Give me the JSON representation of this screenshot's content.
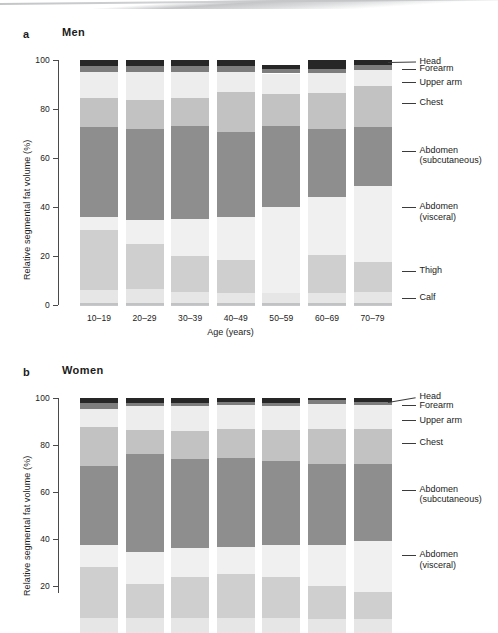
{
  "figure": {
    "panels": [
      {
        "letter": "a",
        "title": "Men",
        "ylabel": "Relative segmental fat volume (%)",
        "xlabel": "Age (years)"
      },
      {
        "letter": "b",
        "title": "Women",
        "ylabel": "Relative segmental fat volume (%)",
        "xlabel": "Age (years)"
      }
    ]
  },
  "legend": {
    "items": [
      {
        "label": "Head",
        "color": "#262626"
      },
      {
        "label": "Forearm",
        "color": "#7d7d7d"
      },
      {
        "label": "Upper arm",
        "color": "#ededed"
      },
      {
        "label": "Chest",
        "color": "#c2c2c2"
      },
      {
        "label": "Abdomen\n(subcutaneous)",
        "line1": "Abdomen",
        "line2": "(subcutaneous)",
        "color": "#8e8e8e"
      },
      {
        "label": "Abdomen\n(visceral)",
        "line1": "Abdomen",
        "line2": "(visceral)",
        "color": "#f0f0f0"
      },
      {
        "label": "Thigh",
        "color": "#cfcfcf"
      },
      {
        "label": "Calf",
        "color": "#e6e6e6"
      }
    ]
  },
  "chart_data": {
    "type": "bar",
    "subtype": "stacked-percent",
    "xlabel": "Age (years)",
    "ylabel": "Relative segmental fat volume (%)",
    "ylim": [
      0,
      100
    ],
    "yticks": [
      0,
      20,
      40,
      60,
      80,
      100
    ],
    "grid": false,
    "legend_position": "right",
    "categories": [
      "10–19",
      "20–29",
      "30–39",
      "40–49",
      "50–59",
      "60–69",
      "70–79"
    ],
    "segment_order_bottom_to_top": [
      "Calf",
      "Thigh",
      "Abdomen (visceral)",
      "Abdomen (subcutaneous)",
      "Chest",
      "Upper arm",
      "Forearm",
      "Head"
    ],
    "panels": [
      {
        "letter": "a",
        "name": "Men",
        "series": [
          {
            "name": "Calf",
            "color": "#e6e6e6",
            "values": [
              6.0,
              6.5,
              5.5,
              5.0,
              5.0,
              5.0,
              5.5
            ]
          },
          {
            "name": "Thigh",
            "color": "#cfcfcf",
            "values": [
              24.5,
              18.5,
              14.5,
              13.5,
              0.0,
              15.5,
              12.0
            ]
          },
          {
            "name": "Abdomen (visceral)",
            "color": "#f0f0f0",
            "values": [
              5.5,
              9.5,
              15.0,
              17.5,
              35.0,
              23.5,
              31.0
            ]
          },
          {
            "name": "Abdomen (subcutaneous)",
            "color": "#8e8e8e",
            "values": [
              36.5,
              37.5,
              38.0,
              34.5,
              33.0,
              28.0,
              24.0
            ]
          },
          {
            "name": "Chest",
            "color": "#c2c2c2",
            "values": [
              12.0,
              11.5,
              11.5,
              16.5,
              13.0,
              14.5,
              17.0
            ]
          },
          {
            "name": "Upper arm",
            "color": "#ededed",
            "values": [
              10.5,
              11.5,
              10.5,
              8.0,
              8.5,
              8.0,
              6.5
            ]
          },
          {
            "name": "Forearm",
            "color": "#7d7d7d",
            "values": [
              2.5,
              2.5,
              2.5,
              2.5,
              2.0,
              2.0,
              2.0
            ]
          },
          {
            "name": "Head",
            "color": "#262626",
            "values": [
              2.5,
              2.5,
              2.5,
              2.5,
              1.5,
              3.5,
              2.0
            ]
          }
        ]
      },
      {
        "letter": "b",
        "name": "Women",
        "note": "Panel is cropped at the bottom of the image; axis visible to 20%.",
        "series": [
          {
            "name": "Calf",
            "color": "#e6e6e6",
            "values": [
              6.5,
              6.5,
              6.5,
              6.5,
              6.5,
              6.0,
              6.0
            ]
          },
          {
            "name": "Thigh",
            "color": "#cfcfcf",
            "values": [
              21.5,
              14.5,
              17.5,
              18.5,
              17.5,
              14.0,
              11.5
            ]
          },
          {
            "name": "Abdomen (visceral)",
            "color": "#f0f0f0",
            "values": [
              9.5,
              13.5,
              12.0,
              11.5,
              13.5,
              17.5,
              21.5
            ]
          },
          {
            "name": "Abdomen (subcutaneous)",
            "color": "#8e8e8e",
            "values": [
              33.5,
              41.5,
              38.0,
              38.0,
              35.5,
              34.5,
              33.0
            ]
          },
          {
            "name": "Chest",
            "color": "#c2c2c2",
            "values": [
              16.5,
              10.5,
              12.0,
              12.5,
              13.5,
              15.0,
              15.0
            ]
          },
          {
            "name": "Upper arm",
            "color": "#ededed",
            "values": [
              8.0,
              10.0,
              10.5,
              10.0,
              10.0,
              10.5,
              10.0
            ]
          },
          {
            "name": "Forearm",
            "color": "#7d7d7d",
            "values": [
              2.5,
              1.5,
              1.5,
              1.5,
              1.5,
              1.5,
              1.5
            ]
          },
          {
            "name": "Head",
            "color": "#262626",
            "values": [
              2.0,
              2.0,
              2.0,
              1.5,
              2.0,
              1.0,
              1.5
            ]
          }
        ]
      }
    ]
  }
}
